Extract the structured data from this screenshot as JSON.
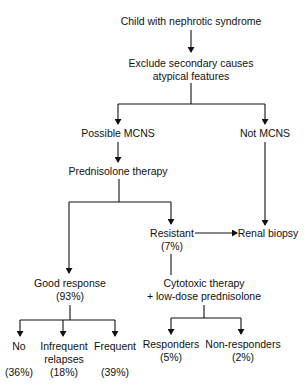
{
  "diagram": {
    "nodes": {
      "root": {
        "lines": [
          "Child with nephrotic syndrome"
        ]
      },
      "exclude": {
        "lines": [
          "Exclude secondary causes",
          "atypical features"
        ]
      },
      "possible_mcns": {
        "lines": [
          "Possible MCNS"
        ]
      },
      "not_mcns": {
        "lines": [
          "Not MCNS"
        ]
      },
      "prednisolone": {
        "lines": [
          "Prednisolone therapy"
        ]
      },
      "resistant": {
        "lines": [
          "Resistant",
          "(7%)"
        ]
      },
      "renal_biopsy": {
        "lines": [
          "Renal biopsy"
        ]
      },
      "good_response": {
        "lines": [
          "Good response",
          "(93%)"
        ]
      },
      "cytotoxic": {
        "lines": [
          "Cytotoxic therapy",
          "+ low-dose prednisolone"
        ]
      },
      "no_relapse": {
        "lines": [
          "No",
          "",
          "(36%)"
        ]
      },
      "infrequent": {
        "lines": [
          "Infrequent",
          "relapses",
          "(18%)"
        ]
      },
      "frequent": {
        "lines": [
          "Frequent",
          "",
          "(39%)"
        ]
      },
      "responders": {
        "lines": [
          "Responders",
          "(5%)"
        ]
      },
      "non_responders": {
        "lines": [
          "Non-responders",
          "(2%)"
        ]
      }
    },
    "edges": [
      [
        "root",
        "exclude"
      ],
      [
        "exclude",
        "possible_mcns"
      ],
      [
        "exclude",
        "not_mcns"
      ],
      [
        "possible_mcns",
        "prednisolone"
      ],
      [
        "not_mcns",
        "renal_biopsy"
      ],
      [
        "prednisolone",
        "good_response"
      ],
      [
        "prednisolone",
        "resistant"
      ],
      [
        "resistant",
        "renal_biopsy"
      ],
      [
        "resistant",
        "cytotoxic"
      ],
      [
        "good_response",
        "no_relapse"
      ],
      [
        "good_response",
        "infrequent"
      ],
      [
        "good_response",
        "frequent"
      ],
      [
        "cytotoxic",
        "responders"
      ],
      [
        "cytotoxic",
        "non_responders"
      ]
    ]
  }
}
